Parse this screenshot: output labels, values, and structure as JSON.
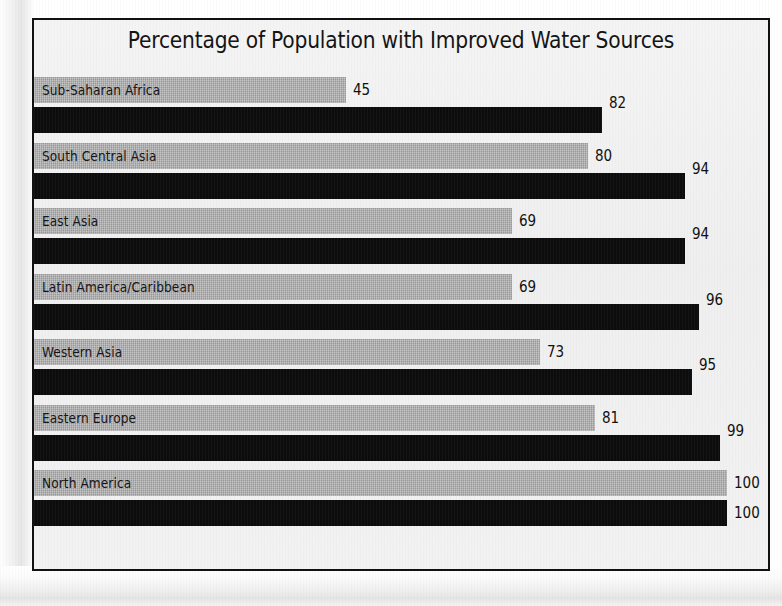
{
  "chart_data": {
    "type": "bar",
    "orientation": "horizontal",
    "title": "Percentage of Population with Improved Water Sources",
    "xlabel": "",
    "ylabel": "",
    "xlim": [
      0,
      100
    ],
    "grid": false,
    "legend": null,
    "categories": [
      "Sub-Saharan Africa",
      "South Central Asia",
      "East Asia",
      "Latin America/Caribbean",
      "Western Asia",
      "Eastern Europe",
      "North America"
    ],
    "series": [
      {
        "name": "light",
        "color": "#a9a9a9",
        "values": [
          45,
          80,
          69,
          69,
          73,
          81,
          100
        ]
      },
      {
        "name": "dark",
        "color": "#0c0c0c",
        "values": [
          82,
          94,
          94,
          96,
          95,
          99,
          100
        ]
      }
    ],
    "rows": [
      {
        "category": "Sub-Saharan Africa",
        "light": 45,
        "dark": 82
      },
      {
        "category": "South Central Asia",
        "light": 80,
        "dark": 94
      },
      {
        "category": "East Asia",
        "light": 69,
        "dark": 94
      },
      {
        "category": "Latin America/Caribbean",
        "light": 69,
        "dark": 96
      },
      {
        "category": "Western Asia",
        "light": 73,
        "dark": 95
      },
      {
        "category": "Eastern Europe",
        "light": 81,
        "dark": 99
      },
      {
        "category": "North America",
        "light": 100,
        "dark": 100
      }
    ]
  },
  "colors": {
    "light_bar": "#a9a9a9",
    "dark_bar": "#0c0c0c",
    "frame_border": "#111111",
    "chart_background": "#f1f1f1",
    "text": "#141414"
  }
}
